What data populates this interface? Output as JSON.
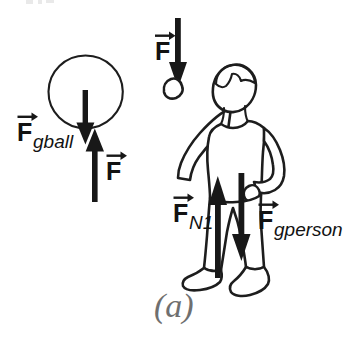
{
  "figure": {
    "caption": "(a)",
    "background_color": "#ffffff",
    "ink_color": "#181818",
    "caption_color": "#6f6f6f"
  },
  "ball_diagram": {
    "name": "ball",
    "forces": [
      {
        "id": "ball-gravity",
        "label_F": "F",
        "subscript": "gball",
        "direction": "down",
        "vector_accent": "arrow-right-overbar"
      },
      {
        "id": "ball-applied",
        "label_F": "F",
        "subscript": "",
        "direction": "up",
        "vector_accent": "arrow-right-overbar"
      }
    ]
  },
  "person_diagram": {
    "name": "person",
    "forces": [
      {
        "id": "hand-applied",
        "label_F": "F",
        "subscript": "",
        "direction": "down",
        "vector_accent": "arrow-right-overbar"
      },
      {
        "id": "person-normal",
        "label_F": "F",
        "subscript": "N1",
        "direction": "up",
        "vector_accent": "arrow-right-overbar"
      },
      {
        "id": "person-gravity",
        "label_F": "F",
        "subscript": "gperson",
        "direction": "down",
        "vector_accent": "arrow-right-overbar"
      }
    ]
  }
}
